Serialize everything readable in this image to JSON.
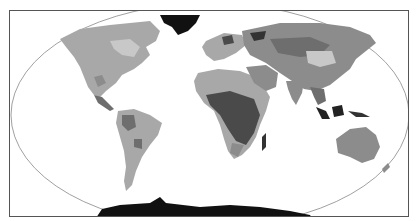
{
  "map": {
    "type": "world-biome-map",
    "projection": "robinson-like",
    "style": "grayscale",
    "shades": {
      "ocean": "#ffffff",
      "light": "#c8c8c8",
      "mid_light": "#a8a8a8",
      "mid": "#8c8c8c",
      "mid_dark": "#6e6e6e",
      "dark": "#4a4a4a",
      "ice": "#111111",
      "frame": "#555555",
      "outline": "#777777"
    },
    "regions": [
      "North America",
      "Greenland",
      "Central America",
      "South America",
      "Europe",
      "Africa",
      "Madagascar",
      "Asia",
      "Middle East",
      "India",
      "Southeast Asia",
      "Indonesia",
      "Australia",
      "New Zealand",
      "Antarctica"
    ]
  }
}
